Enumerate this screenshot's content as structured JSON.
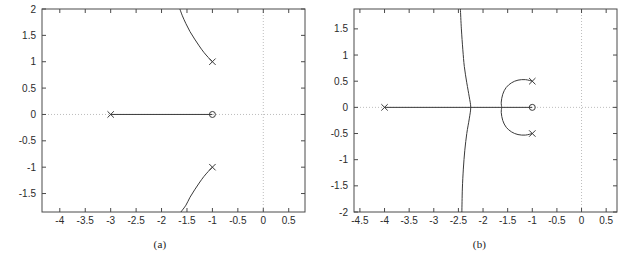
{
  "figure": {
    "background": "#ffffff",
    "curve_color": "#3a3a3a",
    "axis_color": "#4a4a4a",
    "grid_color": "#bdbdbd"
  },
  "panels": [
    {
      "id": "a",
      "caption": "(a)",
      "chart_data": {
        "type": "line",
        "title": "",
        "xlabel": "",
        "ylabel": "",
        "xlim": [
          -4.35,
          0.82
        ],
        "ylim": [
          -1.85,
          2.0
        ],
        "xticks": [
          "-4",
          "-3.5",
          "-3",
          "-2.5",
          "-2",
          "-1.5",
          "-1",
          "-0.5",
          "0",
          "0.5"
        ],
        "xtick_values": [
          -4,
          -3.5,
          -3,
          -2.5,
          -2,
          -1.5,
          -1,
          -0.5,
          0,
          0.5
        ],
        "yticks": [
          "2",
          "1.5",
          "1",
          "0.5",
          "0",
          "-0.5",
          "-1",
          "-1.5"
        ],
        "ytick_values": [
          2,
          1.5,
          1,
          0.5,
          0,
          -0.5,
          -1,
          -1.5
        ],
        "grid": "dotted-zero-lines",
        "legend": "none",
        "markers": [
          {
            "type": "pole",
            "glyph": "x",
            "x": -3.0,
            "y": 0.0
          },
          {
            "type": "pole",
            "glyph": "x",
            "x": -1.0,
            "y": 1.0
          },
          {
            "type": "pole",
            "glyph": "x",
            "x": -1.0,
            "y": -1.0
          },
          {
            "type": "zero",
            "glyph": "o",
            "x": -1.0,
            "y": 0.0
          }
        ],
        "series": [
          {
            "name": "real-axis-branch",
            "points": [
              [
                -3.0,
                0.0
              ],
              [
                -1.0,
                0.0
              ]
            ]
          },
          {
            "name": "upper-branch",
            "points": [
              [
                -1.0,
                1.0
              ],
              [
                -1.08,
                1.08
              ],
              [
                -1.17,
                1.18
              ],
              [
                -1.26,
                1.3
              ],
              [
                -1.35,
                1.43
              ],
              [
                -1.44,
                1.57
              ],
              [
                -1.52,
                1.72
              ],
              [
                -1.59,
                1.87
              ],
              [
                -1.64,
                2.0
              ]
            ]
          },
          {
            "name": "lower-branch",
            "points": [
              [
                -1.0,
                -1.0
              ],
              [
                -1.08,
                -1.08
              ],
              [
                -1.17,
                -1.18
              ],
              [
                -1.26,
                -1.3
              ],
              [
                -1.35,
                -1.43
              ],
              [
                -1.44,
                -1.57
              ],
              [
                -1.52,
                -1.72
              ],
              [
                -1.62,
                -1.85
              ]
            ]
          }
        ]
      }
    },
    {
      "id": "b",
      "caption": "(b)",
      "chart_data": {
        "type": "line",
        "title": "",
        "xlabel": "",
        "ylabel": "",
        "xlim": [
          -4.62,
          0.72
        ],
        "ylim": [
          -2.0,
          1.88
        ],
        "xticks": [
          "-4.5",
          "-4",
          "-3.5",
          "-3",
          "-2.5",
          "-2",
          "-1.5",
          "-1",
          "-0.5",
          "0",
          "0.5"
        ],
        "xtick_values": [
          -4.5,
          -4,
          -3.5,
          -3,
          -2.5,
          -2,
          -1.5,
          -1,
          -0.5,
          0,
          0.5
        ],
        "yticks": [
          "1.5",
          "1",
          "0.5",
          "0",
          "-0.5",
          "-1",
          "-1.5",
          "-2"
        ],
        "ytick_values": [
          1.5,
          1,
          0.5,
          0,
          -0.5,
          -1,
          -1.5,
          -2
        ],
        "grid": "dotted-zero-lines",
        "legend": "none",
        "markers": [
          {
            "type": "pole",
            "glyph": "x",
            "x": -4.0,
            "y": 0.0
          },
          {
            "type": "pole",
            "glyph": "x",
            "x": -1.0,
            "y": 0.5
          },
          {
            "type": "pole",
            "glyph": "x",
            "x": -1.0,
            "y": -0.5
          },
          {
            "type": "zero",
            "glyph": "o",
            "x": -1.0,
            "y": 0.0
          }
        ],
        "series": [
          {
            "name": "real-axis-branch",
            "points": [
              [
                -4.0,
                0.0
              ],
              [
                -1.0,
                0.0
              ]
            ]
          },
          {
            "name": "asymptote-branch",
            "points": [
              [
                -2.46,
                1.88
              ],
              [
                -2.44,
                1.5
              ],
              [
                -2.41,
                1.1
              ],
              [
                -2.38,
                0.78
              ],
              [
                -2.33,
                0.47
              ],
              [
                -2.28,
                0.2
              ],
              [
                -2.25,
                0.0
              ],
              [
                -2.28,
                -0.22
              ],
              [
                -2.33,
                -0.5
              ],
              [
                -2.37,
                -0.82
              ],
              [
                -2.4,
                -1.18
              ],
              [
                -2.42,
                -1.56
              ],
              [
                -2.43,
                -2.0
              ]
            ]
          },
          {
            "name": "upper-arc",
            "points": [
              [
                -1.0,
                0.5
              ],
              [
                -1.14,
                0.53
              ],
              [
                -1.29,
                0.52
              ],
              [
                -1.42,
                0.47
              ],
              [
                -1.53,
                0.38
              ],
              [
                -1.6,
                0.25
              ],
              [
                -1.63,
                0.1
              ],
              [
                -1.62,
                0.0
              ]
            ]
          },
          {
            "name": "lower-arc",
            "points": [
              [
                -1.0,
                -0.5
              ],
              [
                -1.14,
                -0.53
              ],
              [
                -1.29,
                -0.52
              ],
              [
                -1.42,
                -0.47
              ],
              [
                -1.53,
                -0.38
              ],
              [
                -1.6,
                -0.25
              ],
              [
                -1.63,
                -0.1
              ],
              [
                -1.62,
                0.0
              ]
            ]
          }
        ]
      }
    }
  ]
}
